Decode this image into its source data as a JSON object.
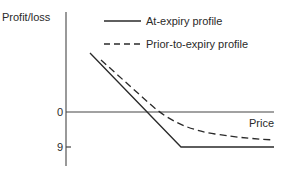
{
  "diagram": {
    "y_axis_label": "Profit/loss",
    "x_axis_label": "Price",
    "ticks": {
      "zero": "0",
      "nine": "9"
    },
    "legend": [
      {
        "label": "At-expiry profile",
        "style": "solid"
      },
      {
        "label": "Prior-to-expiry profile",
        "style": "dashed"
      }
    ],
    "line_color": "#2a2a2a"
  }
}
